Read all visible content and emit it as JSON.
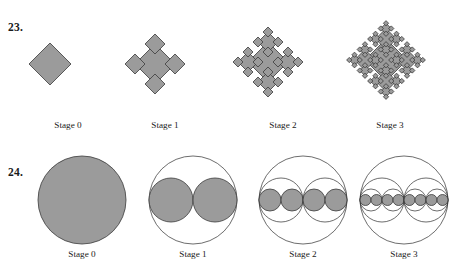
{
  "page": {
    "width": 454,
    "height": 268,
    "background": "#ffffff",
    "ink": "#1a1a1a"
  },
  "style": {
    "fill_gray": "#9b9b9b",
    "stroke_dark": "#3a3a3a",
    "stroke_outline": "#2e2e2e",
    "fill_stroke_width": 0.8,
    "outline_stroke_width": 0.7
  },
  "problems": [
    {
      "number": "23.",
      "number_pos": {
        "x": 8,
        "y": 22
      },
      "type": "diamond-fractal",
      "description": "Square (diamond) fractal: each stage attaches half-scale diamonds at the four vertices of every diamond of the previous stage.",
      "label_y": 121,
      "figures": [
        {
          "stage_label": "Stage 0",
          "label_x": 68,
          "center": {
            "x": 50,
            "y": 64
          },
          "half_diagonal": 21,
          "depth": 0,
          "diamond_count": 1
        },
        {
          "stage_label": "Stage 1",
          "label_x": 165,
          "center": {
            "x": 155,
            "y": 64
          },
          "half_diagonal": 20,
          "depth": 1,
          "diamond_count": 5
        },
        {
          "stage_label": "Stage 2",
          "label_x": 283,
          "center": {
            "x": 268,
            "y": 62
          },
          "half_diagonal": 20,
          "depth": 2,
          "diamond_count": 21
        },
        {
          "stage_label": "Stage 3",
          "label_x": 390,
          "center": {
            "x": 386,
            "y": 60
          },
          "half_diagonal": 21,
          "depth": 3,
          "diamond_count": 85
        }
      ]
    },
    {
      "number": "24.",
      "number_pos": {
        "x": 8,
        "y": 167
      },
      "type": "circle-subdivision-fractal",
      "description": "Circle fractal: at each stage every circle is replaced by two circles of half the diameter lying side by side along the horizontal diameter; earlier stages remain as outlines.",
      "label_y": 250,
      "figures": [
        {
          "stage_label": "Stage 0",
          "label_x": 82,
          "center": {
            "x": 82,
            "y": 200
          },
          "radius": 44,
          "depth": 0,
          "filled_circle_count": 1
        },
        {
          "stage_label": "Stage 1",
          "label_x": 193,
          "center": {
            "x": 193,
            "y": 200
          },
          "radius": 44,
          "depth": 1,
          "filled_circle_count": 2
        },
        {
          "stage_label": "Stage 2",
          "label_x": 303,
          "center": {
            "x": 303,
            "y": 200
          },
          "radius": 44,
          "depth": 2,
          "filled_circle_count": 4
        },
        {
          "stage_label": "Stage 3",
          "label_x": 404,
          "center": {
            "x": 404,
            "y": 200
          },
          "radius": 44,
          "depth": 3,
          "filled_circle_count": 8
        }
      ]
    }
  ]
}
